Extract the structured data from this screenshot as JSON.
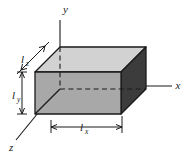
{
  "figure": {
    "type": "3d-box-diagram",
    "background_color": "#ffffff",
    "line_color": "#1a1a1a",
    "axes": [
      {
        "id": "y",
        "label": "y",
        "direction": "up",
        "label_x": 63,
        "label_y": 13
      },
      {
        "id": "x",
        "label": "x",
        "direction": "right",
        "label_x": 178,
        "label_y": 89
      },
      {
        "id": "z",
        "label": "z",
        "direction": "down-left",
        "label_x": 9,
        "label_y": 150
      }
    ],
    "dimensions": [
      {
        "id": "lz",
        "symbol": "l",
        "subscript": "z",
        "label": "lz",
        "orientation": "diagonal",
        "label_x": 22,
        "label_y": 62
      },
      {
        "id": "ly",
        "symbol": "l",
        "subscript": "y",
        "label": "ly",
        "orientation": "vertical",
        "label_x": 15,
        "label_y": 98
      },
      {
        "id": "lx",
        "symbol": "l",
        "subscript": "x",
        "label": "lx",
        "orientation": "horizontal",
        "label_x": 82,
        "label_y": 131
      }
    ],
    "box": {
      "faces": [
        {
          "id": "top-face",
          "name": "top",
          "color": "#d2d2d2"
        },
        {
          "id": "front-face",
          "name": "front",
          "color": "#a8a8a8"
        },
        {
          "id": "right-face",
          "name": "right",
          "color": "#3c3c3c"
        }
      ],
      "hidden_edges_style": "dashed",
      "origin_corner": "top-back-left"
    }
  }
}
